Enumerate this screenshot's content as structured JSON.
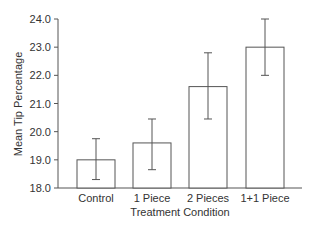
{
  "chart_data": {
    "type": "bar",
    "title": "",
    "xlabel": "Treatment Condition",
    "ylabel": "Mean Tip Percentage",
    "categories": [
      "Control",
      "1 Piece",
      "2 Pieces",
      "1+1 Piece"
    ],
    "values": [
      19.0,
      19.6,
      21.6,
      23.0
    ],
    "error_bars": {
      "lower": [
        18.3,
        18.65,
        20.45,
        22.0
      ],
      "upper": [
        19.75,
        20.45,
        22.8,
        24.0
      ]
    },
    "ylim": [
      18.0,
      24.0
    ],
    "yticks": [
      "18.0",
      "19.0",
      "20.0",
      "21.0",
      "22.0",
      "23.0",
      "24.0"
    ],
    "grid": false,
    "legend": null
  }
}
